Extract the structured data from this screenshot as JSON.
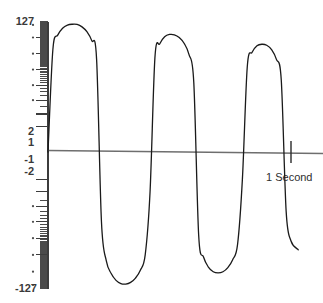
{
  "figure": {
    "title": "",
    "background_color": "#ffffff",
    "curve_color": "#1a1a1a",
    "axis_color": "#6e6e6e",
    "tick_color": "#4a4a4a",
    "label_color": "#3a3a3a"
  },
  "y_axis": {
    "name": "logarithmic-amplitude-scale",
    "labels": [
      {
        "text": "127",
        "value": 127,
        "position": 0.0
      },
      {
        "text": "2",
        "value": 2,
        "position": 0.885
      },
      {
        "text": "1",
        "value": 1,
        "position": 0.935
      },
      {
        "text": "-1",
        "value": -1,
        "position": 1.065
      },
      {
        "text": "-2",
        "value": -2,
        "position": 1.115
      },
      {
        "text": "-127",
        "value": -127,
        "position": 2.0
      }
    ],
    "dot_markers": 12,
    "min": -127,
    "max": 127
  },
  "x_axis": {
    "name": "time-axis",
    "marker_label": "1 Second",
    "marker_value": 1,
    "unit": "Second"
  },
  "chart_data": {
    "type": "line",
    "title": "",
    "subtitle": "",
    "xlabel": "1 Second",
    "ylabel": "",
    "xlim": [
      0,
      1.12
    ],
    "ylim": [
      -127,
      127
    ],
    "grid": false,
    "legend": null,
    "annotations": [
      {
        "text": "1 Second",
        "x": 1.0,
        "y": 0
      },
      {
        "text": "127",
        "x": 0,
        "y": 127
      },
      {
        "text": "2",
        "x": 0,
        "y": 2
      },
      {
        "text": "1",
        "x": 0,
        "y": 1
      },
      {
        "text": "-1",
        "x": 0,
        "y": -1
      },
      {
        "text": "-2",
        "x": 0,
        "y": -2
      },
      {
        "text": "-127",
        "x": 0,
        "y": -127
      }
    ],
    "series": [
      {
        "name": "damped-sine",
        "color": "#1a1a1a",
        "cycles": 3,
        "decay": 0.45,
        "peaks": [
          {
            "x": 0.12,
            "y": 112
          },
          {
            "x": 0.5,
            "y": 73
          },
          {
            "x": 0.855,
            "y": 48
          }
        ],
        "troughs": [
          {
            "x": 0.305,
            "y": -106
          },
          {
            "x": 0.675,
            "y": -67
          }
        ],
        "zero_crossings": [
          0.0,
          0.215,
          0.405,
          0.59,
          0.765,
          0.935,
          1.0
        ],
        "x": [
          0.0,
          0.02,
          0.04,
          0.06,
          0.08,
          0.1,
          0.12,
          0.14,
          0.16,
          0.18,
          0.2,
          0.22,
          0.24,
          0.26,
          0.28,
          0.3,
          0.32,
          0.34,
          0.36,
          0.38,
          0.4,
          0.42,
          0.44,
          0.46,
          0.48,
          0.5,
          0.52,
          0.54,
          0.56,
          0.58,
          0.6,
          0.62,
          0.64,
          0.66,
          0.68,
          0.7,
          0.72,
          0.74,
          0.76,
          0.78,
          0.8,
          0.82,
          0.84,
          0.86,
          0.88,
          0.9,
          0.92,
          0.94,
          0.96,
          0.98,
          1.0
        ],
        "values": [
          0,
          38,
          71,
          95,
          109,
          113,
          112,
          101,
          82,
          56,
          25,
          -8,
          -41,
          -69,
          -91,
          -104,
          -106,
          -99,
          -83,
          -60,
          -32,
          -2,
          27,
          49,
          66,
          73,
          72,
          64,
          50,
          31,
          9,
          -14,
          -35,
          -53,
          -64,
          -67,
          -64,
          -54,
          -39,
          -21,
          -1,
          18,
          34,
          45,
          48,
          46,
          38,
          25,
          10,
          -5,
          -18
        ]
      }
    ]
  }
}
